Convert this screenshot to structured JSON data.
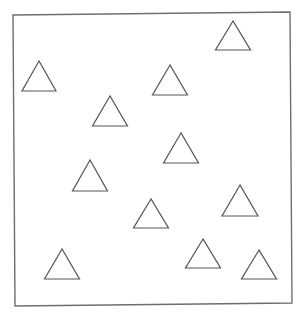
{
  "figure": {
    "shape_type": "equilateral-triangle-outline",
    "shape_count": 11,
    "colors": {
      "background": "#ffffff",
      "frame_stroke": "#6e6e6e",
      "shape_stroke": "#555555",
      "shape_fill": "#ffffff"
    }
  }
}
